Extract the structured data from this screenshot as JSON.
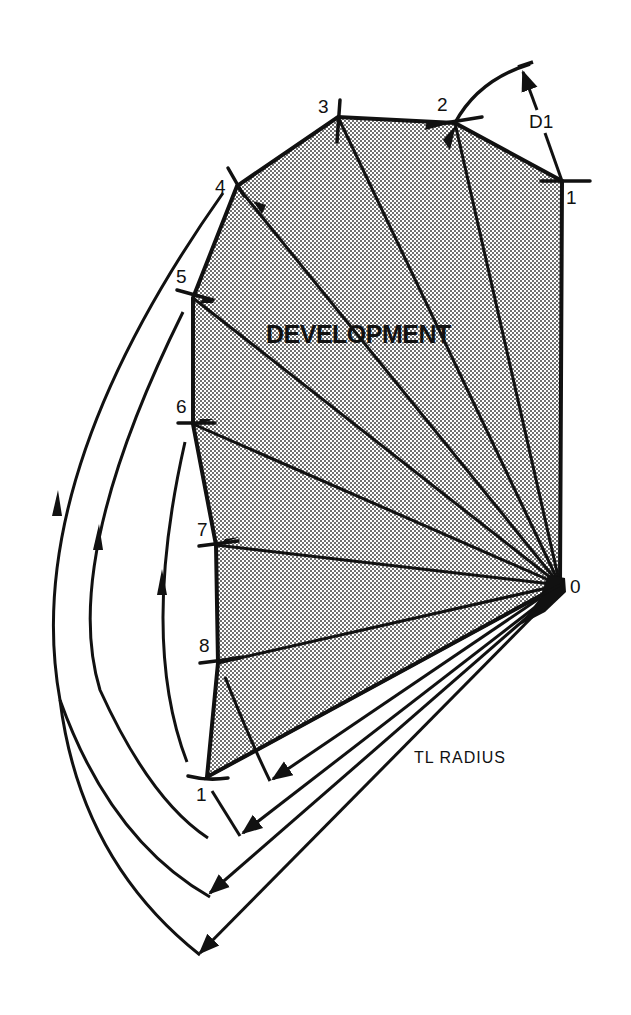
{
  "diagram": {
    "title_label": "DEVELOPMENT",
    "radius_label": "TL RADIUS",
    "angle_label": "D1",
    "apex_label": "0",
    "colors": {
      "ink": "#111111",
      "fill_stipple": "#bdbdbd",
      "background": "#ffffff"
    },
    "apex": {
      "label": "0",
      "x": 560,
      "y": 585
    },
    "vertices": [
      {
        "label": "1",
        "x": 562,
        "y": 181,
        "label_x": 566,
        "label_y": 188
      },
      {
        "label": "2",
        "x": 455,
        "y": 123,
        "label_x": 437,
        "label_y": 95
      },
      {
        "label": "3",
        "x": 338,
        "y": 117,
        "label_x": 318,
        "label_y": 97
      },
      {
        "label": "4",
        "x": 237,
        "y": 186,
        "label_x": 215,
        "label_y": 177
      },
      {
        "label": "5",
        "x": 193,
        "y": 298,
        "label_x": 176,
        "label_y": 267
      },
      {
        "label": "6",
        "x": 193,
        "y": 424,
        "label_x": 176,
        "label_y": 397
      },
      {
        "label": "7",
        "x": 216,
        "y": 545,
        "label_x": 197,
        "label_y": 520
      },
      {
        "label": "8",
        "x": 218,
        "y": 663,
        "label_x": 199,
        "label_y": 636
      },
      {
        "label": "1",
        "x": 207,
        "y": 777,
        "label_x": 196,
        "label_y": 785
      }
    ],
    "swing_arcs": [
      {
        "from_vertex": "8",
        "to": [
          273,
          781
        ]
      },
      {
        "from_vertex": "1",
        "to": [
          243,
          835
        ]
      },
      {
        "from_vertex": "6",
        "to": [
          210,
          895
        ]
      },
      {
        "from_vertex": "5",
        "to": [
          200,
          955
        ]
      }
    ]
  }
}
